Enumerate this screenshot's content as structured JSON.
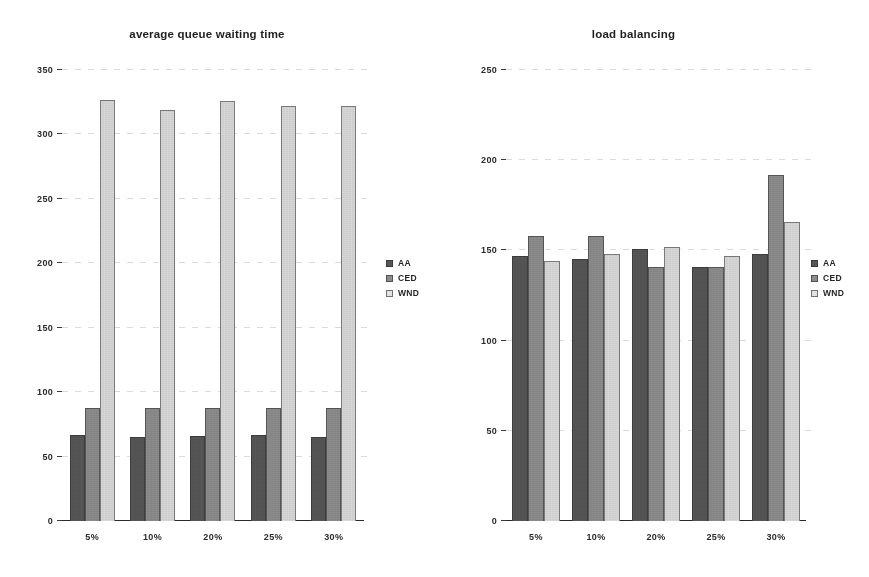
{
  "figure": {
    "series_colors": {
      "AA": "#565656",
      "CED": "#8c8c8c",
      "WND": "#d9d9d9"
    },
    "background": "#ffffff"
  },
  "chart_data": [
    {
      "type": "bar",
      "title": "average queue waiting time",
      "xlabel": "",
      "ylabel": "",
      "categories": [
        "5%",
        "10%",
        "20%",
        "25%",
        "30%"
      ],
      "ylim": [
        0,
        350
      ],
      "yticks": [
        0,
        50,
        100,
        150,
        200,
        250,
        300,
        350
      ],
      "ytick_labels": [
        "0",
        "50",
        "100",
        "150",
        "200",
        "250",
        "300",
        "350"
      ],
      "grid": true,
      "legend": [
        "AA",
        "CED",
        "WND"
      ],
      "legend_position": "right",
      "series": [
        {
          "name": "AA",
          "values": [
            67,
            65,
            66,
            67,
            65
          ]
        },
        {
          "name": "CED",
          "values": [
            88,
            88,
            88,
            88,
            88
          ]
        },
        {
          "name": "WND",
          "values": [
            327,
            319,
            326,
            322,
            322
          ]
        }
      ]
    },
    {
      "type": "bar",
      "title": "load balancing",
      "xlabel": "",
      "ylabel": "",
      "categories": [
        "5%",
        "10%",
        "20%",
        "25%",
        "30%"
      ],
      "ylim": [
        0,
        250
      ],
      "yticks": [
        0,
        50,
        100,
        150,
        200,
        250
      ],
      "ytick_labels": [
        "0",
        "50",
        "100",
        "150",
        "200",
        "250"
      ],
      "grid": true,
      "legend": [
        "AA",
        "CED",
        "WND"
      ],
      "legend_position": "right",
      "series": [
        {
          "name": "AA",
          "values": [
            147,
            145,
            151,
            141,
            148
          ]
        },
        {
          "name": "CED",
          "values": [
            158,
            158,
            141,
            141,
            192
          ]
        },
        {
          "name": "WND",
          "values": [
            144,
            148,
            152,
            147,
            166
          ]
        }
      ]
    }
  ]
}
